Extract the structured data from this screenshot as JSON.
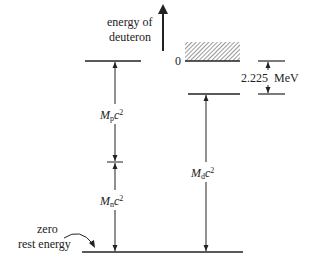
{
  "figure": {
    "axis_label_line1": "energy of",
    "axis_label_line2": "deuteron",
    "zero_label": "0",
    "binding_energy_value": "2.225",
    "binding_energy_unit": "MeV",
    "proton_label_M": "M",
    "proton_label_sub": "p",
    "proton_label_c": "c",
    "proton_label_sup": "2",
    "neutron_label_M": "M",
    "neutron_label_sub": "n",
    "neutron_label_c": "c",
    "neutron_label_sup": "2",
    "deuteron_label_M": "M",
    "deuteron_label_sub": "d",
    "deuteron_label_c": "c",
    "deuteron_label_sup": "2",
    "zero_rest_line1": "zero",
    "zero_rest_line2": "rest energy"
  },
  "colors": {
    "line": "#222222",
    "hatch": "#555555",
    "background": "#ffffff"
  }
}
